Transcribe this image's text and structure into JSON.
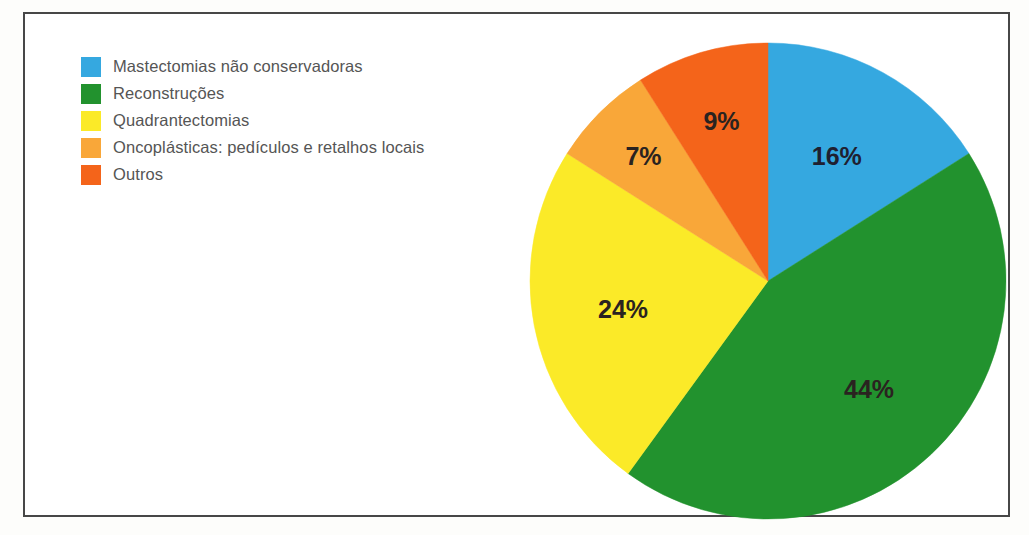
{
  "figure": {
    "background_color": "#ffffff",
    "frame_color": "#474747"
  },
  "legend": {
    "position": "top-left",
    "items": [
      {
        "label": "Mastectomias não conservadoras",
        "color": "#35a8e0"
      },
      {
        "label": "Reconstruções",
        "color": "#22922e"
      },
      {
        "label": "Quadrantectomias",
        "color": "#fbea28"
      },
      {
        "label": "Oncoplásticas: pedículos e retalhos locais",
        "color": "#f9a739"
      },
      {
        "label": "Outros",
        "color": "#f4641a"
      }
    ]
  },
  "chart_data": {
    "type": "pie",
    "title": "",
    "subtitle": "",
    "xlabel": "",
    "ylabel": "",
    "legend_position": "top-left",
    "grid": false,
    "start_angle_deg": 90,
    "direction": "clockwise",
    "units": "percent",
    "categories": [
      "Mastectomias não conservadoras",
      "Reconstruções",
      "Quadrantectomias",
      "Oncoplásticas: pedículos e retalhos locais",
      "Outros"
    ],
    "values": [
      16,
      44,
      24,
      7,
      9
    ],
    "colors": [
      "#35a8e0",
      "#22922e",
      "#fbea28",
      "#f9a739",
      "#f4641a"
    ],
    "data_labels": [
      "16%",
      "44%",
      "24%",
      "7%",
      "9%"
    ],
    "slices": [
      {
        "label": "Mastectomias não conservadoras",
        "value": 16,
        "data_label": "16%",
        "color": "#35a8e0"
      },
      {
        "label": "Reconstruções",
        "value": 44,
        "data_label": "44%",
        "color": "#22922e"
      },
      {
        "label": "Quadrantectomias",
        "value": 24,
        "data_label": "24%",
        "color": "#fbea28"
      },
      {
        "label": "Oncoplásticas: pedículos e retalhos locais",
        "value": 7,
        "data_label": "7%",
        "color": "#f9a739"
      },
      {
        "label": "Outros",
        "value": 9,
        "data_label": "9%",
        "color": "#f4641a"
      }
    ]
  }
}
